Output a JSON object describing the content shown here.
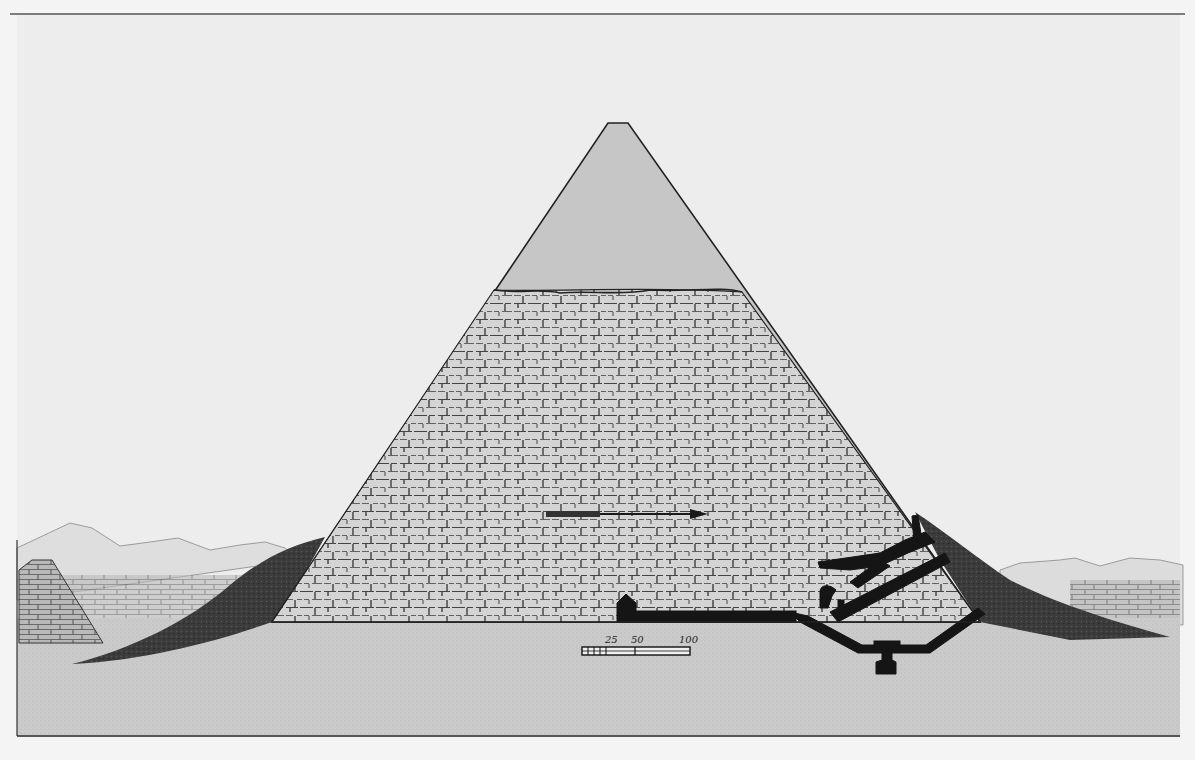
{
  "plate": {
    "subject": "Cross-section of the Great Pyramid",
    "colors": {
      "paper": "#f4f4f4",
      "sky": "#ececec",
      "ground": "#cfcfcf",
      "casing": "#c8c8c8",
      "masonry": "#d6d6d6",
      "rubble": "#3a3a3a",
      "ink": "#151515",
      "mountains": "#dcdcdc"
    }
  },
  "scale_bar": {
    "labels": [
      "25",
      "50",
      "100"
    ]
  }
}
